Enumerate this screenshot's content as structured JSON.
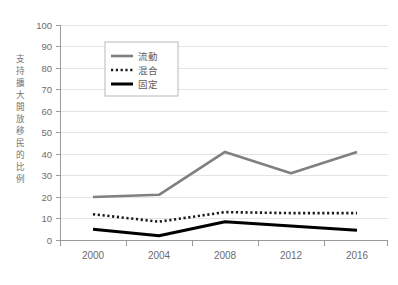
{
  "chart_data": {
    "type": "line",
    "title": "",
    "xlabel": "",
    "ylabel": "支持擴大開放移民的比例",
    "x": [
      2000,
      2004,
      2008,
      2012,
      2016
    ],
    "categories": [
      "2000",
      "2004",
      "2008",
      "2012",
      "2016"
    ],
    "ylim": [
      0,
      100
    ],
    "yticks": [
      0,
      10,
      20,
      30,
      40,
      50,
      60,
      70,
      80,
      90,
      100
    ],
    "ytick_labels": [
      "0",
      "10",
      "20",
      "30",
      "40",
      "50",
      "60",
      "70",
      "80",
      "90",
      "100"
    ],
    "grid": true,
    "grid_axis": "y",
    "legend_position": "upper-left-inside",
    "series": [
      {
        "name": "流動",
        "style": "solid",
        "color": "#808080",
        "values": [
          20,
          21,
          41,
          31,
          41
        ]
      },
      {
        "name": "混合",
        "style": "dotted",
        "color": "#1a1a1a",
        "values": [
          12,
          8.5,
          13,
          12.5,
          12.5
        ]
      },
      {
        "name": "固定",
        "style": "solid-bold",
        "color": "#000000",
        "values": [
          5,
          2,
          8.5,
          6.5,
          4.5
        ]
      }
    ]
  },
  "axis": {
    "y_label_chars": [
      "支",
      "持",
      "擴",
      "大",
      "開",
      "放",
      "移",
      "民",
      "的",
      "比",
      "例"
    ]
  },
  "legend": {
    "items": [
      {
        "label": "流動",
        "swatch": "solid-gray"
      },
      {
        "label": "混合",
        "swatch": "dotted-black"
      },
      {
        "label": "固定",
        "swatch": "solid-black-bold"
      }
    ]
  },
  "colors": {
    "series_fluid": "#808080",
    "series_mixed": "#1a1a1a",
    "series_fixed": "#000000",
    "grid": "#e2e2e2",
    "axis": "#9a9a9a",
    "tick_text": "#6d6d6d",
    "background": "#ffffff"
  }
}
